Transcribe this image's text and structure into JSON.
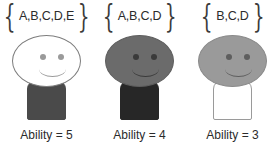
{
  "diagram": {
    "background": "#ffffff",
    "text_color": "#2b2b2b",
    "figures": [
      {
        "set_label": "A,B,C,D,E",
        "brace_open": "{",
        "brace_close": "}",
        "caption": "Ability = 5",
        "ability": 5,
        "head_fill": "#ffffff",
        "head_stroke": "#7d7d7d",
        "body_fill": "#4a4a4a",
        "body_stroke": "#4a4a4a",
        "eye_color": "#9a9a9a",
        "smile_color": "#9a9a9a"
      },
      {
        "set_label": "A,B,C,D",
        "brace_open": "{",
        "brace_close": "}",
        "caption": "Ability = 4",
        "ability": 4,
        "head_fill": "#6b6b6b",
        "head_stroke": "#5e5e5e",
        "body_fill": "#272727",
        "body_stroke": "#272727",
        "eye_color": "#3a3a3a",
        "smile_color": "#3a3a3a"
      },
      {
        "set_label": "B,C,D",
        "brace_open": "{",
        "brace_close": "}",
        "caption": "Ability = 3",
        "ability": 3,
        "head_fill": "#9a9a9a",
        "head_stroke": "#8a8a8a",
        "body_fill": "#ffffff",
        "body_stroke": "#9a9a9a",
        "eye_color": "#5e5e5e",
        "smile_color": "#5e5e5e"
      }
    ]
  }
}
